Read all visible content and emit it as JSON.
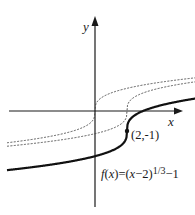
{
  "chart_data": {
    "type": "line",
    "title": "",
    "xlabel": "x",
    "ylabel": "y",
    "grid": false,
    "legend": "none",
    "xlim": [
      -5.6,
      7.2
    ],
    "ylim": [
      -9.5,
      4.5
    ],
    "series": [
      {
        "name": "y = x^(1/3)",
        "style": "dashed",
        "color": "#333333",
        "function": "cbrt(x)",
        "x": [
          -5.5,
          -3,
          -1,
          -0.3,
          0,
          0.3,
          1,
          3,
          7
        ],
        "values": [
          -1.77,
          -1.44,
          -1.0,
          -0.67,
          0.0,
          0.67,
          1.0,
          1.44,
          1.91
        ]
      },
      {
        "name": "y = (x-2)^(1/3)",
        "style": "dashed",
        "color": "#333333",
        "function": "cbrt(x-2)",
        "x": [
          -5.5,
          -3,
          -1,
          1.7,
          2,
          2.3,
          3,
          5,
          7
        ],
        "values": [
          -1.96,
          -1.71,
          -1.44,
          -0.67,
          0.0,
          0.67,
          1.0,
          1.44,
          1.71
        ]
      },
      {
        "name": "f(x) = (x-2)^(1/3) - 1",
        "style": "solid",
        "color": "#111111",
        "function": "cbrt(x-2)-1",
        "x": [
          -5.5,
          -3,
          -1,
          1,
          1.7,
          2,
          2.3,
          3,
          5,
          7
        ],
        "values": [
          -2.96,
          -2.71,
          -2.44,
          -2.0,
          -1.67,
          -1.0,
          -0.33,
          0.0,
          0.44,
          0.71
        ]
      }
    ],
    "annotations": [
      {
        "text": "(2,-1)",
        "x": 2,
        "y": -1,
        "marker": "dot"
      },
      {
        "text": "f(x)=(x−2)^(1/3)−1",
        "position": "below-right of curve"
      }
    ]
  },
  "labels": {
    "x_axis": "x",
    "y_axis": "y",
    "point": "(2,-1)",
    "func_f": "f",
    "func_open": "(",
    "func_x": "x",
    "func_mid": ")=(",
    "func_x2": "x",
    "func_rest": "−2)",
    "func_exp": "1/3",
    "func_tail": "−1"
  },
  "layout": {
    "origin_px": [
      95,
      111
    ],
    "px_per_unit_x": 16,
    "px_per_unit_y": 20,
    "axis_color": "#1a1a1a",
    "curve_color": "#111111",
    "dash_color": "#444444"
  }
}
